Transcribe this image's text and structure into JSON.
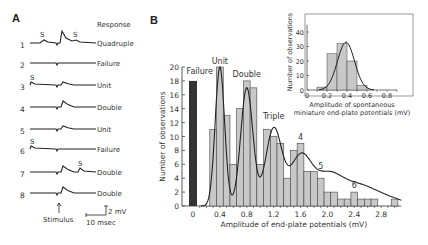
{
  "panel_a": {
    "label": "A",
    "header": "Response",
    "traces": [
      {
        "num": "1",
        "response": "Quadruple",
        "spont": [
          "S",
          "S"
        ]
      },
      {
        "num": "2",
        "response": "Failure",
        "spont": []
      },
      {
        "num": "3",
        "response": "Unit",
        "spont": [
          "S"
        ]
      },
      {
        "num": "4",
        "response": "Double",
        "spont": []
      },
      {
        "num": "5",
        "response": "Unit",
        "spont": []
      },
      {
        "num": "6",
        "response": "Failure",
        "spont": [
          "S"
        ]
      },
      {
        "num": "7",
        "response": "Double",
        "spont": [
          "S"
        ]
      },
      {
        "num": "8",
        "response": "Double",
        "spont": []
      }
    ],
    "stimulus_label": "Stimulus",
    "scale_v": "2 mV",
    "scale_t": "10 msec"
  },
  "panel_b": {
    "label": "B"
  },
  "chart_data": [
    {
      "type": "bar",
      "title": "",
      "xlabel": "Amplitude of end-plate potentials (mV)",
      "ylabel": "Number of observations",
      "xticks": [
        "0",
        "0.4",
        "0.8",
        "1.2",
        "1.6",
        "2.0",
        "2.4",
        "2.8"
      ],
      "yticks": [
        "0",
        "2",
        "4",
        "6",
        "8",
        "10",
        "12",
        "14",
        "16",
        "18",
        "20"
      ],
      "ylim": [
        0,
        20
      ],
      "xlim": [
        0,
        3.1
      ],
      "failure_bar": {
        "label": "Failure",
        "x": 0,
        "value": 18,
        "color": "#333333"
      },
      "bin_width": 0.1,
      "bins_x": [
        0.3,
        0.4,
        0.5,
        0.6,
        0.7,
        0.8,
        0.9,
        1.0,
        1.1,
        1.2,
        1.3,
        1.4,
        1.5,
        1.6,
        1.7,
        1.8,
        1.9,
        2.0,
        2.1,
        2.2,
        2.3,
        2.4,
        2.5,
        2.6,
        2.7,
        2.8,
        2.9,
        3.0
      ],
      "values": [
        11,
        20,
        13,
        6,
        14,
        18,
        17,
        6,
        11,
        10,
        9,
        4,
        8,
        9,
        5,
        5,
        4,
        2,
        2,
        1,
        1,
        2,
        1,
        1,
        1,
        0,
        0,
        1
      ],
      "annotations": [
        {
          "text": "Failure",
          "x": 0.1,
          "y": 19
        },
        {
          "text": "Unit",
          "x": 0.4,
          "y": 20.5
        },
        {
          "text": "Double",
          "x": 0.8,
          "y": 18.5
        },
        {
          "text": "Triple",
          "x": 1.2,
          "y": 12.5
        },
        {
          "text": "4",
          "x": 1.6,
          "y": 9.5
        },
        {
          "text": "5",
          "x": 1.9,
          "y": 5.3
        },
        {
          "text": "6",
          "x": 2.4,
          "y": 2.6
        }
      ],
      "fit_curve": "sum of Poisson-weighted Gaussians",
      "bar_color": "#c8c8c8"
    },
    {
      "type": "bar",
      "title": "inset",
      "xlabel": "Amplitude of spontaneous miniature end-plate potentials (mV)",
      "ylabel": "Number of observations",
      "xticks": [
        "0",
        "0.2",
        "0.4",
        "0.6",
        "0.8"
      ],
      "yticks": [
        "0",
        "10",
        "20",
        "30",
        "40"
      ],
      "ylim": [
        0,
        45
      ],
      "bins_x": [
        0.15,
        0.25,
        0.35,
        0.45,
        0.55
      ],
      "values": [
        2,
        25,
        32,
        20,
        3
      ],
      "fit_curve": "gaussian mean 0.4"
    }
  ]
}
